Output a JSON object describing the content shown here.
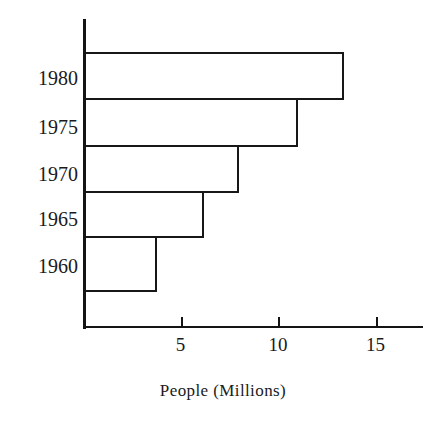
{
  "chart_data": {
    "type": "bar",
    "orientation": "horizontal",
    "title": "",
    "subtitle": "",
    "xlabel": "People (Millions)",
    "ylabel": "",
    "categories": [
      "1980",
      "1975",
      "1970",
      "1965",
      "1960"
    ],
    "values": [
      13.4,
      11.0,
      8.0,
      6.2,
      3.8
    ],
    "series": [
      {
        "name": "People (Millions)",
        "values": [
          13.4,
          11.0,
          8.0,
          6.2,
          3.8
        ]
      }
    ],
    "xlim": [
      0,
      17.5
    ],
    "xticks": [
      5,
      10,
      15
    ],
    "xtick_labels": [
      "5",
      "10",
      "15"
    ],
    "ytick_labels": [
      "1980",
      "1975",
      "1970",
      "1965",
      "1960"
    ],
    "grid": false,
    "legend": false,
    "legend_position": "none",
    "annotations": [],
    "colors": {
      "bar_fill": "#ffffff",
      "bar_edge": "#171717",
      "axis": "#141414",
      "text": "#1a1a1a",
      "background": "#ffffff"
    }
  },
  "axis": {
    "x_title": "People (Millions)",
    "ticks": [
      {
        "label": "5",
        "value": 5
      },
      {
        "label": "10",
        "value": 10
      },
      {
        "label": "15",
        "value": 15
      }
    ]
  },
  "bars": [
    {
      "label": "1980",
      "value": 13.4
    },
    {
      "label": "1975",
      "value": 11.0
    },
    {
      "label": "1970",
      "value": 8.0
    },
    {
      "label": "1965",
      "value": 6.2
    },
    {
      "label": "1960",
      "value": 3.8
    }
  ]
}
